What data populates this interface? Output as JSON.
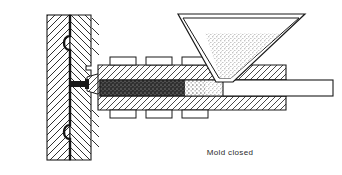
{
  "figure": {
    "caption": "Mold closed",
    "background_color": "#ffffff",
    "line_color": "#1a1a1a"
  },
  "caption": {
    "text": "Mold closed"
  },
  "colors": {
    "outline": "#1a1a1a",
    "hatch": "#2a2a2a",
    "steel_fill": "#ffffff",
    "melt_dark": "#2b2b2b",
    "granulate": "#b9b9b9",
    "caption_text": "#2b2b2b"
  },
  "parts": {
    "mold_fixed_half": {
      "label": "Fixed mold half",
      "hatch_direction": "up-right"
    },
    "mold_moving_half": {
      "label": "Moving mold half",
      "hatch_direction": "down-right"
    },
    "mold_cavity": {
      "label": "Mold cavity"
    },
    "ejector_pin_upper": {
      "label": "Upper ejector pin"
    },
    "ejector_pin_lower": {
      "label": "Lower ejector pin"
    },
    "platen_hatch_upper": {
      "label": "Platen hatch marks upper"
    },
    "platen_hatch_lower": {
      "label": "Platen hatch marks lower"
    },
    "sprue": {
      "label": "Sprue channel"
    },
    "nozzle": {
      "label": "Injection nozzle"
    },
    "barrel": {
      "label": "Heated barrel"
    },
    "heater_bands_top": {
      "label": "Heater bands top",
      "count": 3
    },
    "heater_bands_bottom": {
      "label": "Heater bands bottom",
      "count": 3
    },
    "melt_zone": {
      "label": "Molten polymer zone"
    },
    "transition_zone": {
      "label": "Transition zone"
    },
    "screw_shaft": {
      "label": "Screw shaft"
    },
    "hopper": {
      "label": "Material hopper"
    },
    "hopper_granulate": {
      "label": "Plastic granulate in hopper"
    },
    "hopper_throat": {
      "label": "Hopper feed throat"
    }
  }
}
